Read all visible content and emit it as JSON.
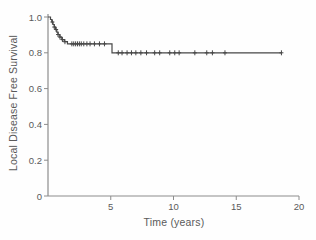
{
  "chart_data": {
    "type": "line",
    "subtype": "kaplan-meier-step-curve",
    "title": "",
    "xlabel": "Time (years)",
    "ylabel": "Local Disease Free Survival",
    "xlim": [
      0,
      20
    ],
    "ylim": [
      0,
      1.0
    ],
    "x_ticks": [
      5,
      10,
      15,
      20
    ],
    "x_tick_labels": [
      "5",
      "10",
      "15",
      "20"
    ],
    "y_ticks": [
      0,
      0.2,
      0.4,
      0.6,
      0.8,
      1.0
    ],
    "y_tick_labels": [
      "0",
      "0.2",
      "0.4",
      "0.6",
      "0.8",
      "1.0"
    ],
    "grid": false,
    "legend": "none",
    "colors": {
      "curve": "#474747",
      "axis": "#8c8c8c",
      "text": "#5a5a5a",
      "background": "#fefefe"
    },
    "series": [
      {
        "name": "Local disease free survival",
        "start": [
          0,
          1.0
        ],
        "end_time": 18.6,
        "steps": [
          [
            0.2,
            0.986
          ],
          [
            0.3,
            0.972
          ],
          [
            0.4,
            0.958
          ],
          [
            0.5,
            0.944
          ],
          [
            0.6,
            0.93
          ],
          [
            0.7,
            0.916
          ],
          [
            0.8,
            0.902
          ],
          [
            0.95,
            0.888
          ],
          [
            1.1,
            0.874
          ],
          [
            1.3,
            0.862
          ],
          [
            1.55,
            0.85
          ],
          [
            5.1,
            0.8
          ]
        ],
        "plateaus": [
          {
            "value": 0.85,
            "from": 1.55,
            "to": 5.1
          },
          {
            "value": 0.8,
            "from": 5.1,
            "to": 18.6
          }
        ],
        "censor_marks": [
          [
            0.35,
            0.972
          ],
          [
            0.5,
            0.944
          ],
          [
            0.65,
            0.93
          ],
          [
            0.8,
            0.902
          ],
          [
            0.95,
            0.888
          ],
          [
            1.15,
            0.874
          ],
          [
            1.35,
            0.862
          ],
          [
            1.9,
            0.85
          ],
          [
            2.05,
            0.85
          ],
          [
            2.2,
            0.85
          ],
          [
            2.35,
            0.85
          ],
          [
            2.5,
            0.85
          ],
          [
            2.65,
            0.85
          ],
          [
            2.85,
            0.85
          ],
          [
            3.1,
            0.85
          ],
          [
            3.35,
            0.85
          ],
          [
            3.7,
            0.85
          ],
          [
            4.1,
            0.85
          ],
          [
            4.5,
            0.85
          ],
          [
            5.6,
            0.8
          ],
          [
            5.9,
            0.8
          ],
          [
            6.3,
            0.8
          ],
          [
            6.65,
            0.8
          ],
          [
            7.0,
            0.8
          ],
          [
            7.4,
            0.8
          ],
          [
            7.85,
            0.8
          ],
          [
            8.5,
            0.8
          ],
          [
            8.9,
            0.8
          ],
          [
            9.7,
            0.8
          ],
          [
            10.1,
            0.8
          ],
          [
            10.45,
            0.8
          ],
          [
            11.7,
            0.8
          ],
          [
            12.65,
            0.8
          ],
          [
            13.1,
            0.8
          ],
          [
            14.1,
            0.8
          ],
          [
            18.6,
            0.8
          ]
        ]
      }
    ]
  }
}
